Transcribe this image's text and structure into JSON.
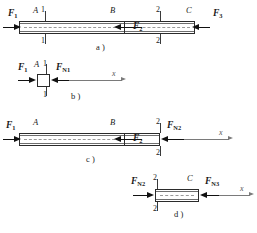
{
  "figure": {
    "axis_label": "x"
  },
  "panels": [
    {
      "id": "a",
      "caption": "a )",
      "points": [
        {
          "label": "A"
        },
        {
          "label": "B"
        },
        {
          "label": "C"
        }
      ],
      "sections": [
        {
          "label": "1",
          "label_bottom": "1"
        },
        {
          "label": "2",
          "label_bottom": "2"
        }
      ],
      "forces": [
        {
          "name": "F",
          "sub": "1",
          "direction": "right"
        },
        {
          "name": "F",
          "sub": "2",
          "direction": "left"
        },
        {
          "name": "F",
          "sub": "3",
          "direction": "left"
        }
      ]
    },
    {
      "id": "b",
      "caption": "b )",
      "points": [
        {
          "label": "A"
        }
      ],
      "sections": [
        {
          "label": "1",
          "label_bottom": "1"
        }
      ],
      "forces": [
        {
          "name": "F",
          "sub": "1",
          "direction": "right"
        },
        {
          "name": "F",
          "sub": "N1",
          "direction": "left"
        }
      ],
      "axis_label": "x"
    },
    {
      "id": "c",
      "caption": "c )",
      "points": [
        {
          "label": "A"
        },
        {
          "label": "B"
        }
      ],
      "sections": [
        {
          "label": "2",
          "label_bottom": "2"
        }
      ],
      "forces": [
        {
          "name": "F",
          "sub": "1",
          "direction": "right"
        },
        {
          "name": "F",
          "sub": "2",
          "direction": "left"
        },
        {
          "name": "F",
          "sub": "N2",
          "direction": "left"
        }
      ],
      "axis_label": "x"
    },
    {
      "id": "d",
      "caption": "d )",
      "points": [
        {
          "label": "C"
        }
      ],
      "sections": [
        {
          "label": "2",
          "label_bottom": "2"
        }
      ],
      "forces": [
        {
          "name": "F",
          "sub": "N2",
          "direction": "right"
        },
        {
          "name": "F",
          "sub": "N3",
          "direction": "left"
        }
      ],
      "axis_label": "x"
    }
  ],
  "labels": {
    "a_caption": "a )",
    "b_caption": "b )",
    "c_caption": "c )",
    "d_caption": "d )",
    "A": "A",
    "B": "B",
    "C": "C",
    "one": "1",
    "two": "2",
    "x": "x",
    "F": "F",
    "sub1": "1",
    "sub2": "2",
    "sub3": "3",
    "subN1": "N1",
    "subN2": "N2",
    "subN3": "N3"
  },
  "colors": {
    "ink": "#1a1a1a",
    "bar_edge": "#2b2b2b",
    "inner_edge": "#6e6e6e",
    "centerline": "#9a9a9a",
    "axis": "#7a7a7a",
    "background": "#ffffff"
  }
}
